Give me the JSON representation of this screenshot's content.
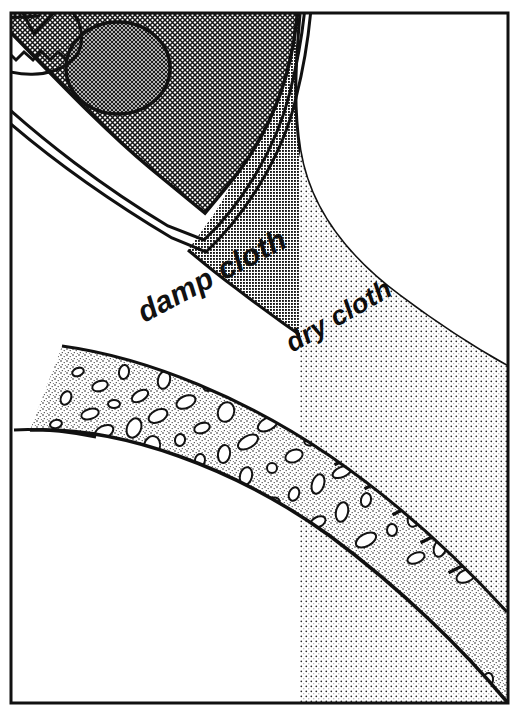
{
  "figure": {
    "name": "ironing-cloth-layers-diagram",
    "kind": "line-art-illustration",
    "background_color": "#ffffff",
    "ink_color": "#111111",
    "frame": {
      "name": "illustration-border",
      "visible": true,
      "stroke_color": "#111111",
      "x": 11,
      "y": 13,
      "width": 497,
      "height": 690
    }
  },
  "labels": {
    "damp_cloth": "damp cloth",
    "dry_cloth": "dry cloth"
  },
  "regions": [
    {
      "id": "iron-soleplate",
      "label": "iron",
      "fill": "crosshatch-medium",
      "fill_color": "#b6b6b6",
      "position": "top-left"
    },
    {
      "id": "iron-knob",
      "label": "steam knob",
      "fill": "crosshatch-dark",
      "fill_color": "#2a2a2a",
      "position": "top-left"
    },
    {
      "id": "damp-cloth-band",
      "label": "damp cloth",
      "fill": "halftone-dark",
      "fill_color": "#6f6f6f",
      "position": "upper-right-diagonal-band"
    },
    {
      "id": "dry-cloth-field",
      "label": "dry cloth",
      "fill": "dots-light",
      "fill_color": "#d8d8d8",
      "position": "lower-right"
    },
    {
      "id": "pebbled-arc",
      "label": "textured fabric arc",
      "fill": "pebbles-on-dots",
      "fill_color": "#e8e8e8",
      "position": "bottom-arc"
    }
  ],
  "colors": {
    "paper": "#ffffff",
    "ink": "#111111",
    "dark_halftone": "#6f6f6f",
    "light_dots": "#d8d8d8",
    "pebble_field": "#ececec",
    "iron_hatch": "#b6b6b6",
    "knob_dark": "#2a2a2a"
  }
}
